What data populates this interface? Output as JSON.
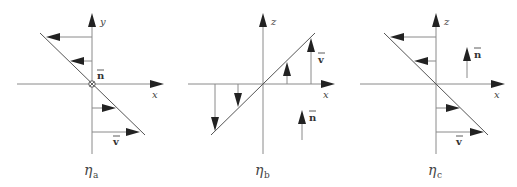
{
  "figure": {
    "panels": [
      {
        "id": "a",
        "caption_symbol": "η",
        "caption_subscript": "a",
        "horizontal_axis_label": "x",
        "vertical_axis_label": "y",
        "normal_label": "n",
        "normal_symbol": "circled-x (into page)",
        "velocity_label": "v",
        "profile": "negative shear (velocity decreases with height)"
      },
      {
        "id": "b",
        "caption_symbol": "η",
        "caption_subscript": "b",
        "horizontal_axis_label": "x",
        "vertical_axis_label": "z",
        "normal_label": "n",
        "normal_symbol": "upward arrow",
        "velocity_label": "v",
        "profile": "positive shear (vertical velocity increases with x)"
      },
      {
        "id": "c",
        "caption_symbol": "η",
        "caption_subscript": "c",
        "horizontal_axis_label": "x",
        "vertical_axis_label": "z",
        "normal_label": "n",
        "normal_symbol": "upward arrow",
        "velocity_label": "v",
        "profile": "negative shear (velocity decreases with height)"
      }
    ]
  }
}
